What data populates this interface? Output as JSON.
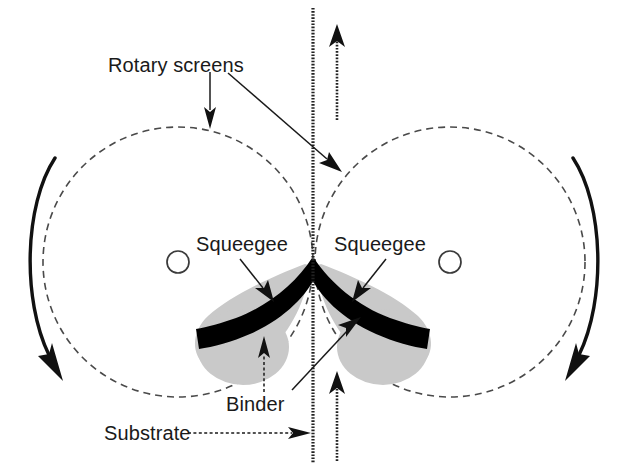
{
  "figure": {
    "background_color": "#ffffff",
    "ink_color": "#111111",
    "binder_color": "#c9c9c9",
    "screen_outline_color": "#4a4a4a"
  },
  "labels": {
    "rotary_screens": "Rotary screens",
    "squeegee_left": "Squeegee",
    "squeegee_right": "Squeegee",
    "binder": "Binder",
    "substrate": "Substrate"
  },
  "components": {
    "left_screen": {
      "name": "left rotary screen",
      "center_x": 178,
      "center_y": 262,
      "radius": 135,
      "rotation": "clockwise"
    },
    "right_screen": {
      "name": "right rotary screen",
      "center_x": 450,
      "center_y": 262,
      "radius": 135,
      "rotation": "counter-clockwise"
    },
    "left_axis": {
      "name": "left screen axis",
      "center_x": 178,
      "center_y": 262,
      "radius": 11
    },
    "right_axis": {
      "name": "right screen axis",
      "center_x": 450,
      "center_y": 262,
      "radius": 11
    },
    "substrate": {
      "name": "substrate web",
      "x": 313,
      "top_y": 8,
      "bottom_y": 463,
      "travel_direction": "upward"
    },
    "nip": {
      "x": 313,
      "y": 262
    }
  },
  "annotations": {
    "rotary_screens_targets": [
      "left screen top arc",
      "right screen upper-left arc"
    ],
    "squeegee_targets": [
      "left squeegee blade",
      "right squeegee blade"
    ],
    "binder_targets": [
      "left binder pool",
      "right binder pool at nip"
    ],
    "substrate_target": "substrate web line",
    "flow_arrow_count": 2,
    "rotation_arrow_count": 2
  }
}
